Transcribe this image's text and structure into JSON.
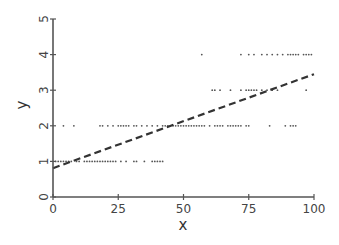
{
  "chart_data": {
    "type": "scatter",
    "title": "",
    "xlabel": "x",
    "ylabel": "y",
    "xlim": [
      0,
      100
    ],
    "ylim": [
      0,
      5
    ],
    "x_ticks": [
      0,
      25,
      50,
      75,
      100
    ],
    "y_ticks": [
      0,
      1,
      2,
      3,
      4,
      5
    ],
    "grid": false,
    "legend": null,
    "series": [
      {
        "name": "observations",
        "type": "scatter",
        "points": [
          [
            1,
            1
          ],
          [
            2,
            1
          ],
          [
            3,
            1
          ],
          [
            4,
            1
          ],
          [
            5,
            1
          ],
          [
            6,
            1
          ],
          [
            7,
            1
          ],
          [
            9,
            1
          ],
          [
            10,
            1
          ],
          [
            12,
            1
          ],
          [
            13,
            1
          ],
          [
            14,
            1
          ],
          [
            15,
            1
          ],
          [
            16,
            1
          ],
          [
            17,
            1
          ],
          [
            18,
            1
          ],
          [
            19,
            1
          ],
          [
            20,
            1
          ],
          [
            21,
            1
          ],
          [
            22,
            1
          ],
          [
            23,
            1
          ],
          [
            24,
            1
          ],
          [
            26,
            1
          ],
          [
            28,
            1
          ],
          [
            31,
            1
          ],
          [
            32,
            1
          ],
          [
            35,
            1
          ],
          [
            38,
            1
          ],
          [
            39,
            1
          ],
          [
            40,
            1
          ],
          [
            41,
            1
          ],
          [
            42,
            1
          ],
          [
            4,
            2
          ],
          [
            8,
            2
          ],
          [
            18,
            2
          ],
          [
            19,
            2
          ],
          [
            21,
            2
          ],
          [
            23,
            2
          ],
          [
            25,
            2
          ],
          [
            26,
            2
          ],
          [
            27,
            2
          ],
          [
            28,
            2
          ],
          [
            29,
            2
          ],
          [
            31,
            2
          ],
          [
            32,
            2
          ],
          [
            34,
            2
          ],
          [
            36,
            2
          ],
          [
            38,
            2
          ],
          [
            40,
            2
          ],
          [
            42,
            2
          ],
          [
            43,
            2
          ],
          [
            44,
            2
          ],
          [
            45,
            2
          ],
          [
            46,
            2
          ],
          [
            47,
            2
          ],
          [
            48,
            2
          ],
          [
            49,
            2
          ],
          [
            50,
            2
          ],
          [
            51,
            2
          ],
          [
            52,
            2
          ],
          [
            53,
            2
          ],
          [
            54,
            2
          ],
          [
            55,
            2
          ],
          [
            56,
            2
          ],
          [
            57,
            2
          ],
          [
            58,
            2
          ],
          [
            60,
            2
          ],
          [
            62,
            2
          ],
          [
            63,
            2
          ],
          [
            64,
            2
          ],
          [
            65,
            2
          ],
          [
            67,
            2
          ],
          [
            68,
            2
          ],
          [
            69,
            2
          ],
          [
            70,
            2
          ],
          [
            71,
            2
          ],
          [
            72,
            2
          ],
          [
            74,
            2
          ],
          [
            75,
            2
          ],
          [
            83,
            2
          ],
          [
            89,
            2
          ],
          [
            91,
            2
          ],
          [
            92,
            2
          ],
          [
            93,
            2
          ],
          [
            61,
            3
          ],
          [
            62,
            3
          ],
          [
            64,
            3
          ],
          [
            68,
            3
          ],
          [
            72,
            3
          ],
          [
            74,
            3
          ],
          [
            75,
            3
          ],
          [
            76,
            3
          ],
          [
            77,
            3
          ],
          [
            78,
            3
          ],
          [
            80,
            3
          ],
          [
            82,
            3
          ],
          [
            84,
            3
          ],
          [
            86,
            3
          ],
          [
            97,
            3
          ],
          [
            57,
            4
          ],
          [
            72,
            4
          ],
          [
            75,
            4
          ],
          [
            77,
            4
          ],
          [
            80,
            4
          ],
          [
            82,
            4
          ],
          [
            84,
            4
          ],
          [
            86,
            4
          ],
          [
            88,
            4
          ],
          [
            90,
            4
          ],
          [
            91,
            4
          ],
          [
            92,
            4
          ],
          [
            93,
            4
          ],
          [
            94,
            4
          ],
          [
            96,
            4
          ],
          [
            97,
            4
          ],
          [
            98,
            4
          ],
          [
            99,
            4
          ]
        ]
      }
    ],
    "trend_line": {
      "style": "dashed",
      "intercept": 0.81,
      "slope": 0.0264,
      "x_range": [
        0,
        100
      ]
    }
  }
}
